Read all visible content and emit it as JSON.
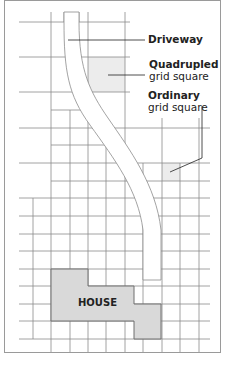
{
  "diagram": {
    "labels": {
      "driveway": "Driveway",
      "quadrupled_title": "Quadrupled",
      "quadrupled_sub": "grid square",
      "ordinary_title": "Ordinary",
      "ordinary_sub": "grid square",
      "house": "HOUSE"
    },
    "colors": {
      "border": "#9a9a9a",
      "grid_line": "#8c8c8c",
      "house_fill": "#d9d9d9",
      "house_stroke": "#6f6f6f",
      "shaded_square": "#ececec",
      "text": "#222222"
    }
  }
}
